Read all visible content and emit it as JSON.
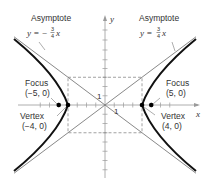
{
  "diagram": {
    "axes": {
      "x_label": "x",
      "y_label": "y",
      "x_tick_label": "1",
      "y_tick_label": "1"
    },
    "asymptotes": [
      {
        "label": "Asymptote",
        "equation_prefix": "y = −",
        "frac_num": "3",
        "frac_den": "4",
        "equation_suffix": "x",
        "slope": -0.75
      },
      {
        "label": "Asymptote",
        "equation_prefix": "y = ",
        "frac_num": "3",
        "frac_den": "4",
        "equation_suffix": "x",
        "slope": 0.75
      }
    ],
    "foci": [
      {
        "label": "Focus",
        "coords": "(−5, 0)",
        "x": -5,
        "y": 0
      },
      {
        "label": "Focus",
        "coords": "(5, 0)",
        "x": 5,
        "y": 0
      }
    ],
    "vertices": [
      {
        "label": "Vertex",
        "coords": "(−4, 0)",
        "x": -4,
        "y": 0
      },
      {
        "label": "Vertex",
        "coords": "(4, 0)",
        "x": 4,
        "y": 0
      }
    ],
    "fundamental_rectangle": {
      "x_range": [
        -4,
        4
      ],
      "y_range": [
        -3,
        3
      ]
    },
    "colors": {
      "curve": "#111111",
      "asymptote": "#777777",
      "axis": "#999999",
      "dashed": "#888888",
      "point": "#000000"
    }
  }
}
